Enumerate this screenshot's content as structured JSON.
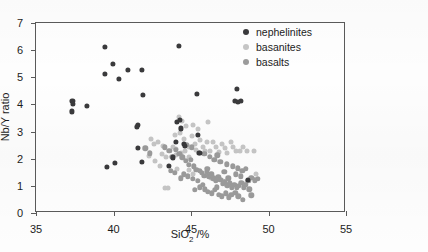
{
  "chart_data": {
    "type": "scatter",
    "title": "",
    "xlabel": "SiO2 /%",
    "ylabel": "Nb/Y ratio",
    "xlim": [
      35,
      55
    ],
    "ylim": [
      0,
      7
    ],
    "xticks": [
      35,
      40,
      45,
      50,
      55
    ],
    "yticks": [
      0,
      1,
      2,
      3,
      4,
      5,
      6,
      7
    ],
    "grid": false,
    "legend_position": "top-right",
    "series": [
      {
        "name": "nephelinites",
        "color": "#3a3a3c",
        "marker_size": 5.2,
        "points": [
          [
            37.35,
            4.12
          ],
          [
            37.38,
            4.02
          ],
          [
            37.33,
            3.74
          ],
          [
            38.3,
            3.95
          ],
          [
            39.45,
            6.12
          ],
          [
            39.42,
            5.12
          ],
          [
            39.95,
            5.48
          ],
          [
            40.35,
            4.93
          ],
          [
            40.95,
            5.28
          ],
          [
            41.85,
            5.27
          ],
          [
            41.9,
            4.34
          ],
          [
            41.55,
            3.26
          ],
          [
            41.5,
            3.17
          ],
          [
            41.6,
            2.4
          ],
          [
            41.85,
            1.88
          ],
          [
            39.55,
            1.69
          ],
          [
            40.1,
            1.85
          ],
          [
            43.55,
            1.74
          ],
          [
            44.2,
            6.15
          ],
          [
            44.3,
            3.42
          ],
          [
            44.1,
            3.36
          ],
          [
            44.35,
            3.12
          ],
          [
            44.55,
            2.55
          ],
          [
            44.6,
            2.48
          ],
          [
            45.4,
            4.4
          ],
          [
            45.45,
            2.88
          ],
          [
            45.5,
            2.2
          ],
          [
            45.55,
            2.22
          ],
          [
            47.95,
            4.58
          ],
          [
            47.85,
            4.12
          ],
          [
            48.05,
            4.1
          ],
          [
            48.2,
            4.12
          ],
          [
            48.65,
            1.22
          ],
          [
            43.85,
            2.05
          ],
          [
            44.05,
            2.62
          ]
        ]
      },
      {
        "name": "basanites",
        "color": "#c6c6c6",
        "marker_size": 5.0,
        "points": [
          [
            41.5,
            3.2
          ],
          [
            42.45,
            2.72
          ],
          [
            42.6,
            2.55
          ],
          [
            42.9,
            2.62
          ],
          [
            43.2,
            2.48
          ],
          [
            43.1,
            2.18
          ],
          [
            43.4,
            2.05
          ],
          [
            43.35,
            0.92
          ],
          [
            43.5,
            0.93
          ],
          [
            43.95,
            2.88
          ],
          [
            43.85,
            2.42
          ],
          [
            44.05,
            2.35
          ],
          [
            44.2,
            3.55
          ],
          [
            44.45,
            3.4
          ],
          [
            44.3,
            2.95
          ],
          [
            44.55,
            2.72
          ],
          [
            44.7,
            3.22
          ],
          [
            44.85,
            2.45
          ],
          [
            44.6,
            2.3
          ],
          [
            44.35,
            2.22
          ],
          [
            44.9,
            2.05
          ],
          [
            45.1,
            3.25
          ],
          [
            45.05,
            2.82
          ],
          [
            45.25,
            2.55
          ],
          [
            45.3,
            2.32
          ],
          [
            45.45,
            3.1
          ],
          [
            45.6,
            2.7
          ],
          [
            45.75,
            2.42
          ],
          [
            45.9,
            2.3
          ],
          [
            46.1,
            3.35
          ],
          [
            46.05,
            2.62
          ],
          [
            46.25,
            2.28
          ],
          [
            46.45,
            2.6
          ],
          [
            46.6,
            2.42
          ],
          [
            46.8,
            2.25
          ],
          [
            47.0,
            2.55
          ],
          [
            47.2,
            2.38
          ],
          [
            47.35,
            2.2
          ],
          [
            47.55,
            2.62
          ],
          [
            47.7,
            2.42
          ],
          [
            47.9,
            2.3
          ],
          [
            48.15,
            2.28
          ],
          [
            48.35,
            2.45
          ],
          [
            48.6,
            2.28
          ],
          [
            49.05,
            2.3
          ],
          [
            49.2,
            1.42
          ],
          [
            42.3,
            2.1
          ],
          [
            42.7,
            1.92
          ],
          [
            43.0,
            1.75
          ],
          [
            44.1,
            1.62
          ],
          [
            44.9,
            1.58
          ],
          [
            45.15,
            1.45
          ],
          [
            46.3,
            1.3
          ],
          [
            47.05,
            1.18
          ],
          [
            48.4,
            1.08
          ],
          [
            44.0,
            2.12
          ]
        ]
      },
      {
        "name": "basalts",
        "color": "#9b9b9b",
        "marker_size": 5.4,
        "points": [
          [
            42.05,
            2.38
          ],
          [
            42.35,
            2.2
          ],
          [
            43.3,
            2.42
          ],
          [
            43.6,
            2.3
          ],
          [
            43.8,
            2.08
          ],
          [
            44.0,
            2.32
          ],
          [
            44.25,
            2.18
          ],
          [
            44.45,
            2.05
          ],
          [
            44.65,
            1.92
          ],
          [
            44.85,
            1.78
          ],
          [
            45.0,
            1.95
          ],
          [
            45.2,
            1.72
          ],
          [
            45.35,
            1.6
          ],
          [
            45.55,
            1.55
          ],
          [
            45.7,
            1.48
          ],
          [
            45.85,
            1.38
          ],
          [
            46.0,
            1.52
          ],
          [
            46.15,
            1.35
          ],
          [
            46.3,
            1.42
          ],
          [
            46.45,
            1.28
          ],
          [
            46.6,
            1.18
          ],
          [
            46.75,
            1.32
          ],
          [
            46.9,
            1.22
          ],
          [
            47.05,
            1.08
          ],
          [
            47.2,
            1.15
          ],
          [
            47.35,
            1.02
          ],
          [
            47.5,
            1.1
          ],
          [
            47.65,
            0.95
          ],
          [
            47.8,
            1.05
          ],
          [
            47.95,
            0.92
          ],
          [
            48.1,
            1.0
          ],
          [
            48.25,
            1.12
          ],
          [
            48.4,
            0.95
          ],
          [
            48.55,
            1.05
          ],
          [
            48.7,
            1.18
          ],
          [
            48.9,
            1.3
          ],
          [
            49.1,
            1.2
          ],
          [
            45.9,
            0.88
          ],
          [
            46.1,
            0.78
          ],
          [
            46.35,
            0.72
          ],
          [
            46.55,
            0.85
          ],
          [
            46.8,
            0.68
          ],
          [
            47.0,
            0.62
          ],
          [
            47.25,
            0.72
          ],
          [
            47.45,
            0.58
          ],
          [
            47.6,
            0.66
          ],
          [
            47.85,
            0.75
          ],
          [
            48.05,
            0.62
          ],
          [
            48.35,
            0.48
          ],
          [
            48.9,
            0.65
          ],
          [
            45.55,
            0.95
          ],
          [
            45.75,
            1.05
          ],
          [
            44.55,
            1.42
          ],
          [
            44.8,
            1.35
          ],
          [
            45.1,
            1.25
          ],
          [
            43.95,
            1.48
          ],
          [
            46.2,
            2.08
          ],
          [
            46.5,
            1.95
          ],
          [
            46.9,
            1.88
          ],
          [
            47.3,
            1.8
          ],
          [
            47.7,
            1.72
          ],
          [
            48.0,
            1.65
          ],
          [
            48.3,
            1.55
          ],
          [
            48.55,
            1.62
          ],
          [
            44.7,
            2.52
          ],
          [
            45.05,
            2.42
          ],
          [
            45.85,
            2.18
          ],
          [
            46.7,
            2.12
          ],
          [
            47.15,
            1.52
          ],
          [
            47.9,
            1.42
          ],
          [
            46.05,
            1.62
          ],
          [
            45.45,
            1.18
          ],
          [
            46.65,
            0.95
          ],
          [
            47.4,
            1.28
          ],
          [
            48.2,
            1.35
          ],
          [
            43.7,
            1.55
          ],
          [
            44.35,
            1.28
          ],
          [
            45.25,
            0.85
          ],
          [
            48.75,
            0.88
          ],
          [
            49.3,
            1.25
          ]
        ]
      }
    ]
  },
  "legend": {
    "items": [
      {
        "label": "nephelinites"
      },
      {
        "label": "basanites"
      },
      {
        "label": "basalts"
      }
    ]
  },
  "axes": {
    "y_tick_labels": [
      "0",
      "1",
      "2",
      "3",
      "4",
      "5",
      "6",
      "7"
    ],
    "x_tick_labels": [
      "35",
      "40",
      "45",
      "50",
      "55"
    ],
    "ylabel_text": "Nb/Y ratio",
    "xlabel_main": "SiO",
    "xlabel_sub": "2",
    "xlabel_tail": " /%"
  }
}
